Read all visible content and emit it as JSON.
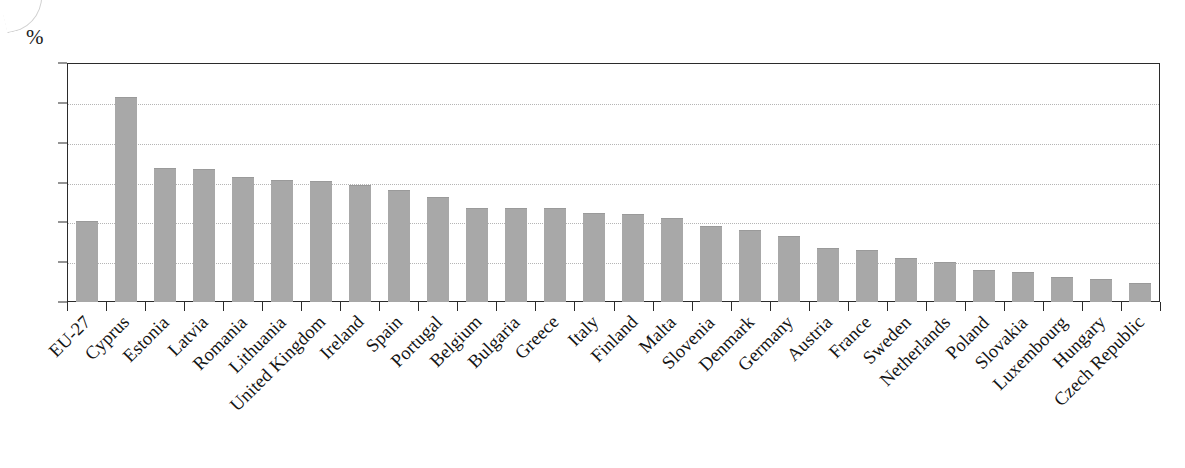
{
  "chart_data": {
    "type": "bar",
    "title": "",
    "subtitle": "",
    "xlabel": "",
    "ylabel": "%",
    "unit_label": "%",
    "ylim": [
      0,
      60
    ],
    "ytick_step": 10,
    "yticks": [
      "0",
      "10",
      "20",
      "30",
      "40",
      "50",
      "60"
    ],
    "grid": true,
    "grid_orientation": "horizontal",
    "grid_style": "dotted",
    "legend": null,
    "legend_position": "none",
    "bar_color": "#a8a8a8",
    "axis_color": "#2b2b2b",
    "gridline_color": "#b5b5b5",
    "categories": [
      "EU-27",
      "Cyprus",
      "Estonia",
      "Latvia",
      "Romania",
      "Lithuania",
      "United Kingdom",
      "Ireland",
      "Spain",
      "Portugal",
      "Belgium",
      "Bulgaria",
      "Greece",
      "Italy",
      "Finland",
      "Malta",
      "Slovenia",
      "Denmark",
      "Germany",
      "Austria",
      "France",
      "Sweden",
      "Netherlands",
      "Poland",
      "Slovakia",
      "Luxembourg",
      "Hungary",
      "Czech Republic"
    ],
    "values": [
      20.0,
      51.3,
      33.4,
      33.2,
      31.1,
      30.3,
      30.2,
      29.0,
      27.8,
      26.0,
      23.3,
      23.3,
      23.3,
      22.0,
      21.9,
      20.8,
      18.8,
      17.8,
      16.3,
      13.3,
      12.8,
      10.8,
      9.8,
      7.7,
      7.2,
      6.0,
      5.6,
      4.4
    ]
  }
}
